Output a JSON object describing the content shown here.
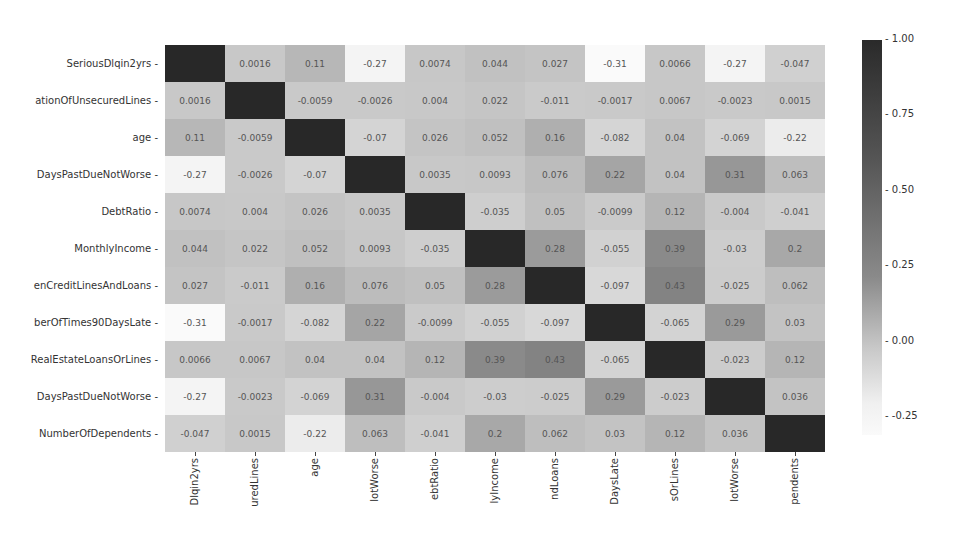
{
  "chart_data": {
    "type": "heatmap",
    "title": "",
    "row_labels": [
      "SeriousDlqin2yrs",
      "ationOfUnsecuredLines",
      "age",
      "DaysPastDueNotWorse",
      "DebtRatio",
      "MonthlyIncome",
      "enCreditLinesAndLoans",
      "berOfTimes90DaysLate",
      "RealEstateLoansOrLines",
      "DaysPastDueNotWorse",
      "NumberOfDependents"
    ],
    "col_labels": [
      "Dlqin2yrs",
      "uredLines",
      "age",
      "lotWorse",
      "ebtRatio",
      "lyIncome",
      "ndLoans",
      "DaysLate",
      "sOrLines",
      "lotWorse",
      "pendents"
    ],
    "values": [
      [
        1,
        0.0016,
        0.11,
        -0.27,
        0.0074,
        0.044,
        0.027,
        -0.31,
        0.0066,
        -0.27,
        -0.047
      ],
      [
        0.0016,
        1,
        -0.0059,
        -0.0026,
        0.004,
        0.022,
        -0.011,
        -0.0017,
        0.0067,
        -0.0023,
        0.0015
      ],
      [
        0.11,
        -0.0059,
        1,
        -0.07,
        0.026,
        0.052,
        0.16,
        -0.082,
        0.04,
        -0.069,
        -0.22
      ],
      [
        -0.27,
        -0.0026,
        -0.07,
        1,
        0.0035,
        0.0093,
        0.076,
        0.22,
        0.04,
        0.31,
        0.063
      ],
      [
        0.0074,
        0.004,
        0.026,
        0.0035,
        1,
        -0.035,
        0.05,
        -0.0099,
        0.12,
        -0.004,
        -0.041
      ],
      [
        0.044,
        0.022,
        0.052,
        0.0093,
        -0.035,
        1,
        0.28,
        -0.055,
        0.39,
        -0.03,
        0.2
      ],
      [
        0.027,
        -0.011,
        0.16,
        0.076,
        0.05,
        0.28,
        1,
        -0.097,
        0.43,
        -0.025,
        0.062
      ],
      [
        -0.31,
        -0.0017,
        -0.082,
        0.22,
        -0.0099,
        -0.055,
        -0.097,
        1,
        -0.065,
        0.29,
        0.03
      ],
      [
        0.0066,
        0.0067,
        0.04,
        0.04,
        0.12,
        0.39,
        0.43,
        -0.065,
        1,
        -0.023,
        0.12
      ],
      [
        -0.27,
        -0.0023,
        -0.069,
        0.31,
        -0.004,
        -0.03,
        -0.025,
        0.29,
        -0.023,
        1,
        0.036
      ],
      [
        -0.047,
        0.0015,
        -0.22,
        0.063,
        -0.041,
        0.2,
        0.062,
        0.03,
        0.12,
        0.036,
        1
      ]
    ],
    "show_diagonal_annotations": false,
    "colorbar": {
      "min": -0.31,
      "max": 1.0,
      "ticks": [
        "1.00",
        "0.75",
        "0.50",
        "0.25",
        "0.00",
        "-0.25"
      ]
    },
    "colormap": "grayscale (light=low, dark=high)"
  }
}
